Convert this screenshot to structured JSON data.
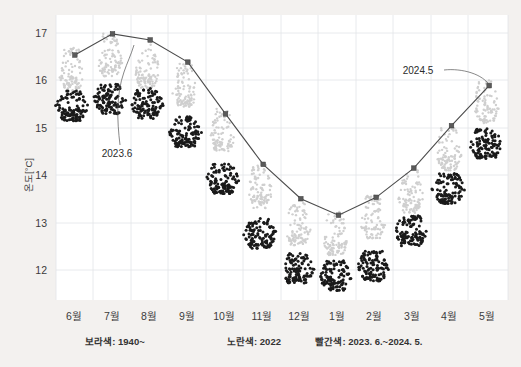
{
  "chart_data": {
    "type": "scatter",
    "title": "",
    "xlabel": "",
    "ylabel": "온도[°C]",
    "ylim": [
      11.3,
      17.35
    ],
    "xlim": [
      0.5,
      12.5
    ],
    "grid": true,
    "legend_position": "below-axis",
    "yticks": [
      "12",
      "13",
      "14",
      "15",
      "16",
      "17"
    ],
    "ytick_values": [
      12,
      13,
      14,
      15,
      16,
      17
    ],
    "categories": [
      "6월",
      "7월",
      "8월",
      "9월",
      "10월",
      "11월",
      "12월",
      "1월",
      "2월",
      "3월",
      "4월",
      "5월"
    ],
    "series": [
      {
        "name": "빨간색: 2023. 6.~2024. 5.",
        "render": "line-with-markers",
        "color": "#4b4b4b",
        "values": [
          16.5,
          16.95,
          16.82,
          16.35,
          15.25,
          14.18,
          13.45,
          13.1,
          13.48,
          14.1,
          15.0,
          15.85
        ]
      },
      {
        "name": "노란색: 2022",
        "render": "dot-cloud-light",
        "color": "#cfcfcf",
        "values": [
          16.05,
          16.35,
          16.1,
          15.7,
          14.75,
          13.55,
          12.75,
          12.55,
          12.9,
          13.45,
          14.35,
          15.35
        ]
      },
      {
        "name": "보라색: 1940~",
        "render": "dot-cloud-dark",
        "color": "#1a1a1a",
        "values": [
          15.4,
          15.55,
          15.45,
          14.85,
          13.85,
          12.7,
          11.95,
          11.8,
          12.0,
          12.75,
          13.65,
          14.6
        ]
      }
    ],
    "annotations": [
      {
        "text": "2023.6",
        "target_category": "7월",
        "target_value": 16.95
      },
      {
        "text": "2024.5",
        "target_category": "5월",
        "target_value": 15.85
      }
    ]
  },
  "legend": {
    "items": [
      {
        "label": "보라색: 1940~"
      },
      {
        "label": "노란색: 2022"
      },
      {
        "label": "빨간색: 2023. 6.~2024. 5."
      }
    ]
  },
  "axis": {
    "y_title": "온도[°C]"
  }
}
